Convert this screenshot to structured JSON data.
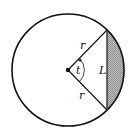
{
  "diagram": {
    "type": "circle-segment",
    "labels": {
      "radius_upper": "r",
      "radius_lower": "r",
      "angle": "t",
      "chord": "L"
    },
    "colors": {
      "stroke": "#111111",
      "segment_fill": "#a8a8a8",
      "background": "#ffffff"
    }
  }
}
